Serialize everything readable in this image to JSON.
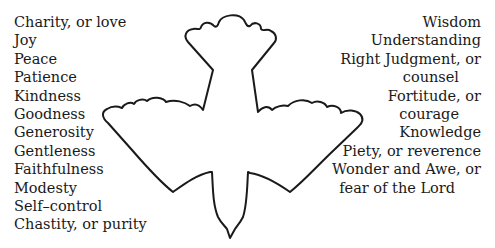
{
  "fruits_of_the_spirit": [
    "Charity, or love",
    "Joy",
    "Peace",
    "Patience",
    "Kindness",
    "Goodness",
    "Generosity",
    "Gentleness",
    "Faithfulness",
    "Modesty",
    "Self–control",
    "Chastity, or purity"
  ],
  "gifts_of_the_spirit": [
    "Wisdom",
    "Understanding",
    "Right Judgment, or",
    "counsel",
    "Fortitude, or",
    "courage",
    "Knowledge",
    "Piety, or reverence",
    "Wonder and Awe, or",
    "fear of the Lord"
  ],
  "illustration": {
    "subject": "dove-outline",
    "stroke_color": "#1a1a1a",
    "fill_color": "#ffffff"
  }
}
